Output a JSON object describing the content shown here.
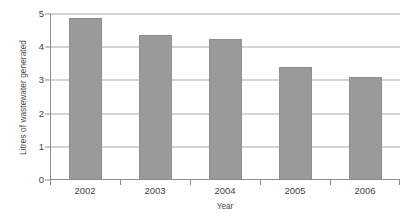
{
  "chart_data": {
    "type": "bar",
    "title": "",
    "subtitle": "",
    "xlabel": "Year",
    "ylabel": "Litres of wastewater generated",
    "categories": [
      "2002",
      "2003",
      "2004",
      "2005",
      "2006"
    ],
    "values": [
      4.88,
      4.38,
      4.25,
      3.4,
      3.1
    ],
    "series": [
      {
        "name": "Litres of wastewater generated",
        "values": [
          4.88,
          4.38,
          4.25,
          3.4,
          3.1
        ]
      }
    ],
    "ylim": [
      0,
      5
    ],
    "yticks": [
      0,
      1,
      2,
      3,
      4,
      5
    ],
    "ytick_labels": [
      "0",
      "1",
      "2",
      "3",
      "4",
      "5"
    ],
    "grid": true,
    "grid_axis": "y",
    "legend": false,
    "legend_position": "none",
    "bar_color": "#9a9a9a",
    "bar_border_color": "#8f8f8f",
    "axis_color": "#8d8d8d",
    "gridline_color": "#a9a9a9",
    "background_color": "#ffffff",
    "annotations": []
  }
}
